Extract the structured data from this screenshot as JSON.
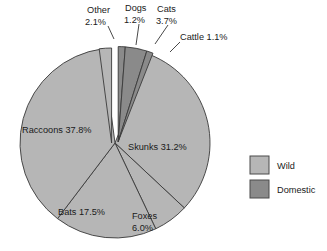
{
  "chart_data": {
    "type": "pie",
    "title": "",
    "subtitle": "",
    "xlabel": "",
    "ylabel": "",
    "grid": false,
    "legend_position": "right",
    "start_angle_deg": 0,
    "direction": "clockwise",
    "categories": [
      "Dogs",
      "Cats",
      "Cattle",
      "Skunks",
      "Foxes",
      "Bats",
      "Raccoons",
      "Other"
    ],
    "values": [
      1.2,
      3.7,
      1.1,
      31.2,
      6.0,
      17.5,
      37.8,
      2.1
    ],
    "units": "percent",
    "slices": [
      {
        "name": "Dogs",
        "value": 1.2,
        "label": "Dogs",
        "value_label": "1.2%",
        "group": "Domestic",
        "color": "#8a8a8a",
        "exploded": true,
        "label_placement": "outside"
      },
      {
        "name": "Cats",
        "value": 3.7,
        "label": "Cats",
        "value_label": "3.7%",
        "group": "Domestic",
        "color": "#8a8a8a",
        "exploded": true,
        "label_placement": "outside"
      },
      {
        "name": "Cattle",
        "value": 1.1,
        "label": "Cattle",
        "value_label": "1.1%",
        "group": "Domestic",
        "color": "#8a8a8a",
        "exploded": true,
        "label_placement": "outside"
      },
      {
        "name": "Skunks",
        "value": 31.2,
        "label": "Skunks",
        "value_label": "31.2%",
        "group": "Wild",
        "color": "#b6b6b6",
        "exploded": false,
        "label_placement": "inside"
      },
      {
        "name": "Foxes",
        "value": 6.0,
        "label": "Foxes",
        "value_label": "6.0%",
        "group": "Wild",
        "color": "#b6b6b6",
        "exploded": false,
        "label_placement": "inside"
      },
      {
        "name": "Bats",
        "value": 17.5,
        "label": "Bats",
        "value_label": "17.5%",
        "group": "Wild",
        "color": "#b6b6b6",
        "exploded": false,
        "label_placement": "inside"
      },
      {
        "name": "Raccoons",
        "value": 37.8,
        "label": "Raccoons",
        "value_label": "37.8%",
        "group": "Wild",
        "color": "#b6b6b6",
        "exploded": false,
        "label_placement": "inside"
      },
      {
        "name": "Other",
        "value": 2.1,
        "label": "Other",
        "value_label": "2.1%",
        "group": "Wild",
        "color": "#b6b6b6",
        "exploded": true,
        "label_placement": "outside"
      }
    ]
  },
  "labels": {
    "other_name": "Other",
    "other_value": "2.1%",
    "dogs_name": "Dogs",
    "dogs_value": "1.2%",
    "cats_name": "Cats",
    "cats_value": "3.7%",
    "cattle_combined": "Cattle 1.1%",
    "raccoons_combined": "Raccoons 37.8%",
    "skunks_combined": "Skunks 31.2%",
    "bats_combined": "Bats 17.5%",
    "foxes_name": "Foxes",
    "foxes_value": "6.0%"
  },
  "legend": {
    "items": [
      {
        "label": "Wild",
        "color": "#b6b6b6"
      },
      {
        "label": "Domestic",
        "color": "#8a8a8a"
      }
    ]
  },
  "colors": {
    "wild": "#b6b6b6",
    "domestic": "#8a8a8a",
    "outline": "#3a3a3a",
    "text": "#1a1a1a",
    "background": "#ffffff"
  }
}
